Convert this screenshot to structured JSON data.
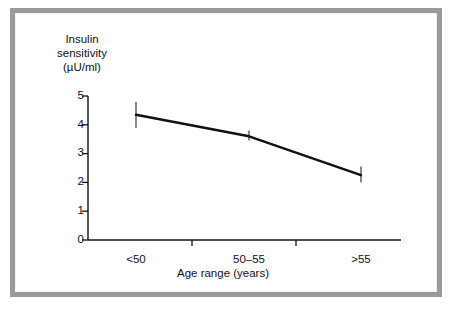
{
  "figure": {
    "frame_color": "#9a9a9a",
    "background": "#ffffff",
    "line_color": "#111111",
    "errorbar_color": "#555555"
  },
  "chart_data": {
    "type": "line",
    "title": "",
    "xlabel": "Age range (years)",
    "ylabel": "Insulin sensitivity (µU/ml)",
    "ylabel_lines": [
      "Insulin",
      "sensitivity",
      "(µU/ml)"
    ],
    "categories": [
      "<50",
      "50–55",
      ">55"
    ],
    "values": [
      4.35,
      3.6,
      2.25
    ],
    "error_low": [
      3.9,
      3.45,
      2.0
    ],
    "error_high": [
      4.8,
      3.8,
      2.55
    ],
    "yticks": [
      0,
      1,
      2,
      3,
      4,
      5
    ],
    "ytick_labels": [
      "0",
      "1",
      "2",
      "3",
      "4",
      "5"
    ],
    "ylim": [
      0,
      5
    ],
    "grid": false,
    "legend": false,
    "legend_position": "none",
    "series": [
      {
        "name": "Insulin sensitivity",
        "values": [
          4.35,
          3.6,
          2.25
        ]
      }
    ]
  }
}
